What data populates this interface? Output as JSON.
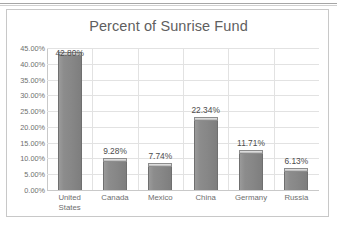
{
  "chart_data": {
    "type": "bar",
    "title": "Percent of Sunrise Fund",
    "xlabel": "",
    "ylabel": "",
    "categories": [
      "United States",
      "Canada",
      "Mexico",
      "China",
      "Germany",
      "Russia"
    ],
    "category_lines": [
      [
        "United",
        "States"
      ],
      [
        "Canada"
      ],
      [
        "Mexico"
      ],
      [
        "China"
      ],
      [
        "Germany"
      ],
      [
        "Russia"
      ]
    ],
    "values": [
      42.8,
      9.28,
      7.74,
      22.34,
      11.71,
      6.13
    ],
    "data_labels": [
      "42.80%",
      "9.28%",
      "7.74%",
      "22.34%",
      "11.71%",
      "6.13%"
    ],
    "ylim": [
      0,
      45
    ],
    "ytick_values": [
      0,
      5,
      10,
      15,
      20,
      25,
      30,
      35,
      40,
      45
    ],
    "ytick_labels": [
      "0.00%",
      "5.00%",
      "10.00%",
      "15.00%",
      "20.00%",
      "25.00%",
      "30.00%",
      "35.00%",
      "40.00%",
      "45.00%"
    ],
    "grid": true,
    "legend": false,
    "bar_color": "#8a8a8a",
    "bar_top_color": "#c2c2c2",
    "gridline_color": "#e2e2e2",
    "text_color": "#6e6e6e",
    "plot_background": "#ffffff"
  }
}
